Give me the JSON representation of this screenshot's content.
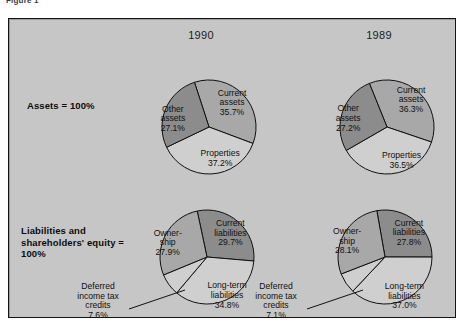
{
  "figure": {
    "caption": "Figure 1"
  },
  "panel": {
    "background_color": "#c6c6c6",
    "border_color": "#141414"
  },
  "columns": [
    {
      "id": "col-1990",
      "year": "1990"
    },
    {
      "id": "col-1989",
      "year": "1989"
    }
  ],
  "rows": [
    {
      "id": "row-assets",
      "label": "Assets\n= 100%"
    },
    {
      "id": "row-liabilities",
      "label": "Liabilities and\nshareholders'\nequity\n= 100%"
    }
  ],
  "palette": {
    "light": "#cfcfcf",
    "medium": "#a8a8a8",
    "dark": "#8c8c8c",
    "outline": "#101010"
  },
  "callouts": {
    "deferred_1990": "Deferred\nincome tax\ncredits\n7.6%",
    "deferred_1989": "Deferred\nincome tax\ncredits\n7.1%"
  },
  "chart_data": [
    {
      "id": "assets-1990",
      "type": "pie",
      "title": "Assets 1990",
      "year": "1990",
      "group": "Assets = 100%",
      "total": 100.0,
      "categories": [
        "Current assets",
        "Properties",
        "Other assets"
      ],
      "values": [
        35.7,
        37.2,
        27.1
      ],
      "labels": [
        "Current\nassets\n35.7%",
        "Properties\n37.2%",
        "Other\nassets\n27.1%"
      ],
      "colors": [
        "#a8a8a8",
        "#cfcfcf",
        "#8c8c8c"
      ],
      "start_angle_deg": -18,
      "legend": "none",
      "grid": false
    },
    {
      "id": "assets-1989",
      "type": "pie",
      "title": "Assets 1989",
      "year": "1989",
      "group": "Assets = 100%",
      "total": 100.0,
      "categories": [
        "Current assets",
        "Properties",
        "Other assets"
      ],
      "values": [
        36.3,
        36.5,
        27.2
      ],
      "labels": [
        "Current\nassets\n36.3%",
        "Properties\n36.5%",
        "Other\nassets\n27.2%"
      ],
      "colors": [
        "#a8a8a8",
        "#cfcfcf",
        "#8c8c8c"
      ],
      "start_angle_deg": -22,
      "legend": "none",
      "grid": false
    },
    {
      "id": "liabilities-1990",
      "type": "pie",
      "title": "Liabilities and shareholders' equity 1990",
      "year": "1990",
      "group": "Liabilities and shareholders' equity = 100%",
      "total": 100.0,
      "categories": [
        "Current liabilities",
        "Long-term liabilities",
        "Deferred income tax credits",
        "Ownership"
      ],
      "values": [
        29.7,
        34.8,
        7.6,
        27.9
      ],
      "labels": [
        "Current\nliabilities\n29.7%",
        "Long-term\nliabilities\n34.8%",
        "Deferred\nincome tax\ncredits\n7.6%",
        "Owner-\nship\n27.9%"
      ],
      "colors": [
        "#8c8c8c",
        "#cfcfcf",
        "#cfcfcf",
        "#a8a8a8"
      ],
      "start_angle_deg": -12,
      "legend": "none",
      "grid": false
    },
    {
      "id": "liabilities-1989",
      "type": "pie",
      "title": "Liabilities and shareholders' equity 1989",
      "year": "1989",
      "group": "Liabilities and shareholders' equity = 100%",
      "total": 100.0,
      "categories": [
        "Current liabilities",
        "Long-term liabilities",
        "Deferred income tax credits",
        "Ownership"
      ],
      "values": [
        27.8,
        37.0,
        7.1,
        28.1
      ],
      "labels": [
        "Current\nliabilities\n27.8%",
        "Long-term\nliabilities\n37.0%",
        "Deferred\nincome tax\ncredits\n7.1%",
        "Owner-\nship\n28.1%"
      ],
      "colors": [
        "#8c8c8c",
        "#cfcfcf",
        "#cfcfcf",
        "#a8a8a8"
      ],
      "start_angle_deg": -10,
      "legend": "none",
      "grid": false
    }
  ]
}
